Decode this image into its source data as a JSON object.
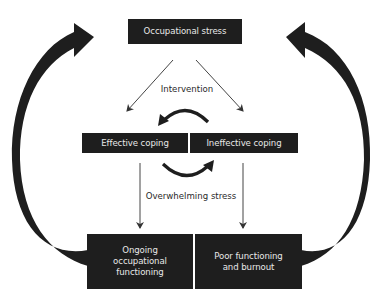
{
  "diagram": {
    "nodes": {
      "occupational_stress": "Occupational stress",
      "effective_coping": "Effective coping",
      "ineffective_coping": "Ineffective coping",
      "ongoing_functioning": "Ongoing occupational functioning",
      "poor_functioning": "Poor functioning and burnout"
    },
    "edge_labels": {
      "intervention": "Intervention",
      "overwhelming_stress": "Overwhelming stress"
    },
    "edges": [
      {
        "from": "occupational_stress",
        "to": "effective_coping",
        "style": "thin-arrow"
      },
      {
        "from": "occupational_stress",
        "to": "ineffective_coping",
        "style": "thin-arrow"
      },
      {
        "from": "ineffective_coping",
        "to": "effective_coping",
        "style": "curved-arrow",
        "label": "intervention"
      },
      {
        "from": "effective_coping",
        "to": "ineffective_coping",
        "style": "curved-arrow",
        "label": "overwhelming_stress"
      },
      {
        "from": "effective_coping",
        "to": "ongoing_functioning",
        "style": "thin-arrow"
      },
      {
        "from": "ineffective_coping",
        "to": "poor_functioning",
        "style": "thin-arrow"
      },
      {
        "from": "ongoing_functioning",
        "to": "occupational_stress",
        "style": "thick-feedback-arrow"
      },
      {
        "from": "poor_functioning",
        "to": "occupational_stress",
        "style": "thick-feedback-arrow"
      }
    ],
    "colors": {
      "box_fill": "#1e1e1e",
      "box_text": "#e8e8e8",
      "line": "#333333",
      "background": "#ffffff"
    }
  }
}
